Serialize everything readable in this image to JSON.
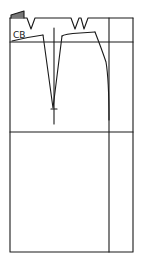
{
  "diagram": {
    "type": "sewing-pattern",
    "labels": {
      "center_back": "CB"
    },
    "colors": {
      "line": "#1a1a1a",
      "background": "#ffffff"
    },
    "elements": [
      "outer-rectangle",
      "hip-line",
      "lower-horizontal-line",
      "side-seam-guide",
      "waist-curve",
      "back-dart-left",
      "back-dart-right",
      "side-seam-curve",
      "top-notch-darts",
      "corner-flag"
    ]
  }
}
